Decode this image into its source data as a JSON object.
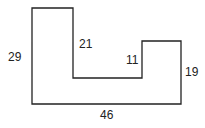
{
  "diagram": {
    "type": "rectilinear-polygon",
    "shape_points": "32,8 73,8 73,78 142,78 142,41 181,41 181,104 32,104",
    "stroke_color": "#222222",
    "labels": {
      "left_side": "29",
      "inner_left_vertical": "21",
      "inner_right_vertical": "11",
      "right_side": "19",
      "bottom": "46"
    }
  }
}
